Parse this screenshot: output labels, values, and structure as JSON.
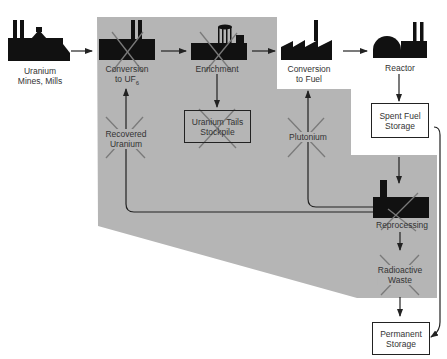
{
  "diagram": {
    "colors": {
      "eliminated_region": "#b5b5b5",
      "icon": "#111111",
      "cross": "#7a7a7a",
      "line": "#222222",
      "text": "#333333"
    },
    "nodes": {
      "mines": {
        "label1": "Uranium",
        "label2": "Mines, Mills",
        "icon": "mine-mill-icon",
        "eliminated": false
      },
      "conversion_uf6": {
        "label1": "Conversion",
        "label2": "to UF",
        "sub": "6",
        "icon": "factory-icon",
        "eliminated": true
      },
      "enrichment": {
        "label1": "Enrichment",
        "icon": "enrichment-plant-icon",
        "eliminated": true
      },
      "conversion_fuel": {
        "label1": "Conversion",
        "label2": "to Fuel",
        "icon": "sawtooth-factory-icon",
        "eliminated": false
      },
      "reactor": {
        "label1": "Reactor",
        "icon": "reactor-dome-icon",
        "eliminated": false
      },
      "tails": {
        "label1": "Uranium Tails",
        "label2": "Stockpile",
        "eliminated": true
      },
      "recovered": {
        "label1": "Recovered",
        "label2": "Uranium",
        "eliminated": true
      },
      "plutonium": {
        "label1": "Plutonium",
        "eliminated": true
      },
      "spent_fuel": {
        "label1": "Spent Fuel",
        "label2": "Storage",
        "eliminated": false
      },
      "reprocessing": {
        "label1": "Reprocessing",
        "icon": "reprocessing-plant-icon",
        "eliminated": true
      },
      "waste": {
        "label1": "Radioactive",
        "label2": "Waste",
        "eliminated": true
      },
      "permanent": {
        "label1": "Permanent",
        "label2": "Storage",
        "eliminated": false
      }
    },
    "edges": [
      {
        "from": "Uranium Mines, Mills",
        "to": "Conversion to UF6"
      },
      {
        "from": "Conversion to UF6",
        "to": "Enrichment"
      },
      {
        "from": "Enrichment",
        "to": "Conversion to Fuel"
      },
      {
        "from": "Conversion to Fuel",
        "to": "Reactor"
      },
      {
        "from": "Enrichment",
        "to": "Uranium Tails Stockpile"
      },
      {
        "from": "Reactor",
        "to": "Spent Fuel Storage"
      },
      {
        "from": "Spent Fuel Storage",
        "to": "Reprocessing"
      },
      {
        "from": "Spent Fuel Storage",
        "to": "Permanent Storage"
      },
      {
        "from": "Reprocessing",
        "to": "Recovered Uranium",
        "then": "Conversion to UF6"
      },
      {
        "from": "Reprocessing",
        "to": "Plutonium",
        "then": "Conversion to Fuel"
      },
      {
        "from": "Reprocessing",
        "to": "Radioactive Waste"
      },
      {
        "from": "Radioactive Waste",
        "to": "Permanent Storage"
      }
    ]
  }
}
